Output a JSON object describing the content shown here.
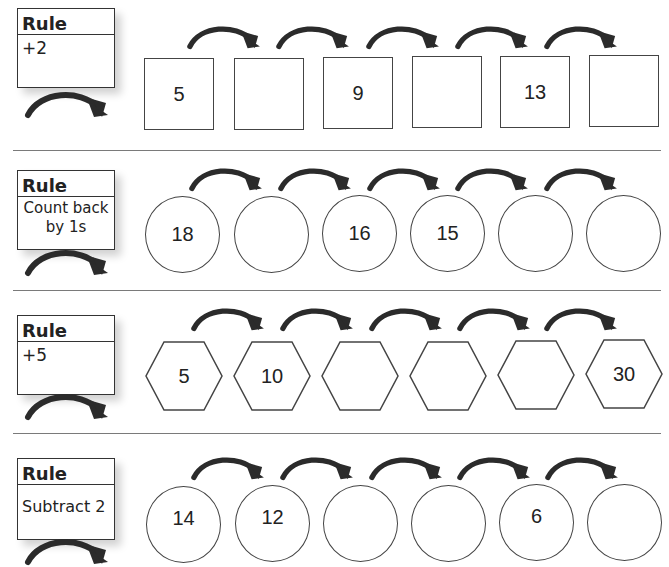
{
  "worksheet": {
    "rows": [
      {
        "rule_title": "Rule",
        "rule_text": "+2",
        "shape": "square",
        "cells": [
          "5",
          "",
          "9",
          "",
          "13",
          ""
        ]
      },
      {
        "rule_title": "Rule",
        "rule_text_line1": "Count back",
        "rule_text_line2": "by 1s",
        "shape": "circle",
        "cells": [
          "18",
          "",
          "16",
          "15",
          "",
          ""
        ]
      },
      {
        "rule_title": "Rule",
        "rule_text": "+5",
        "shape": "hexagon",
        "cells": [
          "5",
          "10",
          "",
          "",
          "",
          "30"
        ]
      },
      {
        "rule_title": "Rule",
        "rule_text": "Subtract 2",
        "shape": "circle",
        "cells": [
          "14",
          "12",
          "",
          "",
          "6",
          ""
        ]
      }
    ],
    "icons": {
      "arrow": "curved-arrow-right-icon"
    },
    "colors": {
      "ink": "#222222",
      "arrow": "#2b2b2b",
      "separator": "#7a7a7a"
    }
  }
}
